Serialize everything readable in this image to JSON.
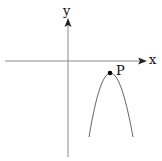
{
  "diagram": {
    "axes": {
      "x_label": "x",
      "y_label": "y"
    },
    "curve": {
      "type": "downward parabola",
      "vertex_label": "P",
      "vertex_quadrant": "IV"
    },
    "colors": {
      "axis": "#808080",
      "curve": "#555555",
      "point": "#000000",
      "text": "#111111"
    }
  }
}
